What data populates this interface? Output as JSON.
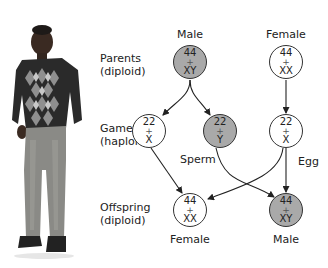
{
  "colors": {
    "male_fill": "#a9a9a9",
    "female_fill": "#ffffff",
    "stroke": "#333333",
    "text": "#222222"
  },
  "row_labels": {
    "parents": [
      "Parents",
      "(diploid)"
    ],
    "gametes": [
      "Gametes",
      "(haploid)"
    ],
    "offspring": [
      "Offspring",
      "(diploid)"
    ]
  },
  "parents": {
    "male": {
      "heading": "Male",
      "autosomes": "44",
      "plus": "+",
      "sex": "XY",
      "fill": "gray"
    },
    "female": {
      "heading": "Female",
      "autosomes": "44",
      "plus": "+",
      "sex": "XX",
      "fill": "white"
    }
  },
  "gametes": {
    "sperm_x": {
      "autosomes": "22",
      "plus": "+",
      "sex": "X",
      "fill": "white"
    },
    "sperm_y": {
      "autosomes": "22",
      "plus": "+",
      "sex": "Y",
      "fill": "gray"
    },
    "egg_x": {
      "autosomes": "22",
      "plus": "+",
      "sex": "X",
      "fill": "white"
    },
    "sperm_label": "Sperm",
    "egg_label": "Egg"
  },
  "offspring": {
    "female": {
      "autosomes": "44",
      "plus": "+",
      "sex": "XX",
      "fill": "white",
      "caption": "Female"
    },
    "male": {
      "autosomes": "44",
      "plus": "+",
      "sex": "XY",
      "fill": "gray",
      "caption": "Male"
    }
  },
  "photo": {
    "subject": "man-standing-argyle-sweater"
  }
}
